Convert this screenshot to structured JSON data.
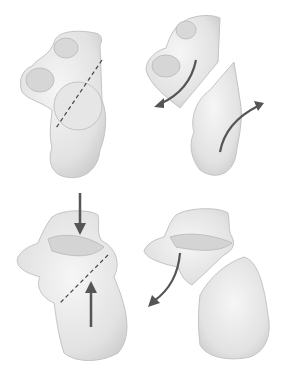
{
  "figure": {
    "background": "#ffffff",
    "bone_fill": "#e9e9e9",
    "bone_shade": "#cfcfcf",
    "bone_edge": "#bdbdbd",
    "arrow_color": "#555555",
    "cut_line_color": "#444444",
    "panels": [
      {
        "id": "top-left",
        "label": "",
        "annotation": "dashed-cut-line"
      },
      {
        "id": "top-right",
        "label": "",
        "annotation": "rotation-arrows"
      },
      {
        "id": "bottom-left",
        "label": "",
        "annotation": "compression-arrows-and-cut-line"
      },
      {
        "id": "bottom-right",
        "label": "",
        "annotation": "curved-displacement-arrow"
      }
    ]
  }
}
